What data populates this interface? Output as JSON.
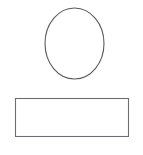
{
  "figure": {
    "title": "",
    "background_color": "#ffffff",
    "width": 143,
    "height": 155,
    "shapes": [
      {
        "id": "ellipse",
        "name": "ellipse-shape",
        "label": "",
        "kind": "ellipse",
        "cx": 74.5,
        "cy": 43.5,
        "rx": 29.5,
        "ry": 35.5,
        "stroke_color": "#5a5a5e",
        "stroke_width": 1.1,
        "fill_color": "none"
      },
      {
        "id": "rectangle",
        "name": "rectangle-shape",
        "label": "",
        "kind": "rect",
        "x": 15.5,
        "y": 98.5,
        "width": 113,
        "height": 38,
        "stroke_color": "#6e6e72",
        "stroke_width": 1.1,
        "fill_color": "none"
      }
    ]
  }
}
